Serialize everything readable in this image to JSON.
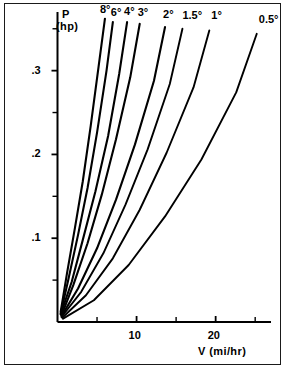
{
  "figure": {
    "frame": true,
    "background": "#ffffff",
    "ink": "#000000"
  },
  "axes": {
    "y_label_line1": "P",
    "y_label_line2": "(hp)",
    "x_label": "V (mi/hr)",
    "y_tick_labels": [
      ".1",
      ".2",
      ".3"
    ],
    "y_tick_values": [
      0.1,
      0.2,
      0.3
    ],
    "x_tick_labels": [
      "10",
      "20"
    ],
    "x_tick_values": [
      10,
      20
    ]
  },
  "chart_data": {
    "type": "line",
    "title": "",
    "subtitle": "",
    "xlabel": "V (mi/hr)",
    "ylabel": "P (hp)",
    "xlim": [
      0,
      27
    ],
    "ylim": [
      0,
      0.37
    ],
    "grid": false,
    "legend_position": "curve-end-labels",
    "x_major_ticks": [
      10,
      20
    ],
    "x_minor_ticks": [
      5,
      15,
      25
    ],
    "y_major_ticks": [
      0.1,
      0.2,
      0.3
    ],
    "y_minor_ticks": [
      0.05,
      0.15,
      0.25,
      0.35
    ],
    "annotations": [
      "Curves labeled by road grade angle in degrees",
      "All curves originate near V=0, P=0"
    ],
    "series": [
      {
        "name": "8°",
        "label": "8°",
        "grade_deg": 8,
        "x": [
          0.4,
          1.2,
          2.2,
          3.2,
          4.2,
          5.2,
          6.0
        ],
        "y": [
          0.012,
          0.058,
          0.112,
          0.168,
          0.234,
          0.305,
          0.362
        ]
      },
      {
        "name": "6°",
        "label": "6°",
        "grade_deg": 6,
        "x": [
          0.4,
          1.4,
          2.6,
          3.8,
          5.0,
          6.2,
          7.0
        ],
        "y": [
          0.01,
          0.052,
          0.104,
          0.16,
          0.226,
          0.3,
          0.358
        ]
      },
      {
        "name": "4°",
        "label": "4°",
        "grade_deg": 4,
        "x": [
          0.4,
          1.8,
          3.2,
          4.8,
          6.4,
          7.8,
          8.8
        ],
        "y": [
          0.009,
          0.048,
          0.098,
          0.156,
          0.222,
          0.296,
          0.358
        ]
      },
      {
        "name": "3°",
        "label": "3°",
        "grade_deg": 3,
        "x": [
          0.5,
          2.0,
          3.8,
          5.6,
          7.4,
          9.2,
          10.4
        ],
        "y": [
          0.008,
          0.044,
          0.094,
          0.152,
          0.218,
          0.292,
          0.356
        ]
      },
      {
        "name": "2°",
        "label": "2°",
        "grade_deg": 2,
        "x": [
          0.5,
          2.6,
          5.0,
          7.4,
          9.8,
          12.2,
          13.6
        ],
        "y": [
          0.007,
          0.04,
          0.088,
          0.146,
          0.212,
          0.288,
          0.352
        ]
      },
      {
        "name": "1.5°",
        "label": "1.5°",
        "grade_deg": 1.5,
        "x": [
          0.5,
          3.0,
          5.8,
          8.6,
          11.4,
          14.2,
          15.8
        ],
        "y": [
          0.006,
          0.036,
          0.082,
          0.14,
          0.206,
          0.284,
          0.35
        ]
      },
      {
        "name": "1°",
        "label": "1°",
        "grade_deg": 1,
        "x": [
          0.6,
          3.6,
          7.0,
          10.4,
          13.8,
          17.2,
          19.2
        ],
        "y": [
          0.005,
          0.032,
          0.076,
          0.134,
          0.202,
          0.28,
          0.348
        ]
      },
      {
        "name": "0.5°",
        "label": "0.5°",
        "grade_deg": 0.5,
        "x": [
          0.7,
          4.6,
          9.0,
          13.6,
          18.2,
          22.6,
          25.2
        ],
        "y": [
          0.004,
          0.026,
          0.068,
          0.126,
          0.194,
          0.274,
          0.344
        ]
      }
    ]
  }
}
